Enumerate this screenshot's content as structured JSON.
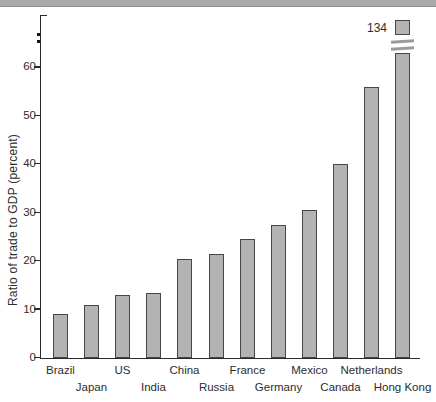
{
  "window": {
    "top_strip_color": "#a9a9a9"
  },
  "chart_data": {
    "type": "bar",
    "title": "",
    "xlabel": "",
    "ylabel": "Ratio of trade to GDP (percent)",
    "ylim": [
      0,
      65
    ],
    "yticks": [
      0,
      10,
      20,
      30,
      40,
      50,
      60
    ],
    "grid": false,
    "legend": null,
    "axis_break_dots": true,
    "categories": [
      "Brazil",
      "Japan",
      "US",
      "India",
      "China",
      "Russia",
      "France",
      "Germany",
      "Mexico",
      "Canada",
      "Netherlands",
      "Hong Kong"
    ],
    "values": [
      9,
      11,
      13,
      13.5,
      20.5,
      21.5,
      24.5,
      27.5,
      30.5,
      40,
      56,
      134
    ],
    "broken_bar": {
      "category": "Hong Kong",
      "actual_value": 134,
      "drawn_top_value": 63,
      "annotation": "134"
    },
    "bar_color": "#b3b3b3",
    "bar_border_color": "#474747"
  }
}
